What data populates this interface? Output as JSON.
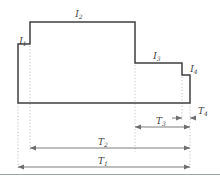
{
  "figure": {
    "type": "step-profile-dimension-diagram",
    "colors": {
      "outline": "#3f3f3f",
      "extension_line": "#bdbdbd",
      "dimension_line": "#7a7a7a",
      "label_text": "#3a3a3a",
      "divider": "#9aa7a0",
      "background": "#ffffff"
    },
    "interval_labels": [
      {
        "id": "I1",
        "base": "I",
        "sub": "1",
        "x": 23,
        "y": 44
      },
      {
        "id": "I2",
        "base": "I",
        "sub": "2",
        "x": 79,
        "y": 17
      },
      {
        "id": "I3",
        "base": "I",
        "sub": "3",
        "x": 157,
        "y": 59
      },
      {
        "id": "I4",
        "base": "I",
        "sub": "4",
        "x": 194,
        "y": 72
      }
    ],
    "dimension_labels": [
      {
        "id": "T1",
        "base": "T",
        "sub": "1",
        "x": 103,
        "y": 163
      },
      {
        "id": "T2",
        "base": "T",
        "sub": "2",
        "x": 103,
        "y": 144
      },
      {
        "id": "T3",
        "base": "T",
        "sub": "3",
        "x": 161,
        "y": 124
      },
      {
        "id": "T4",
        "base": "T",
        "sub": "4",
        "x": 201,
        "y": 113
      }
    ],
    "outline_path": "M 18,103 L 18,44 L 30,44 L 30,22 L 135,22 L 135,63 L 182,63 L 182,75 L 190,75 L 190,103 Z",
    "extension_lines": [
      {
        "id": "ext-left",
        "x": 18,
        "y1": 103,
        "y2": 170
      },
      {
        "id": "ext-step1",
        "x": 30,
        "y1": 46,
        "y2": 152
      },
      {
        "id": "ext-step2",
        "x": 135,
        "y1": 65,
        "y2": 152
      },
      {
        "id": "ext-step3",
        "x": 182,
        "y1": 77,
        "y2": 122
      },
      {
        "id": "ext-right",
        "x": 190,
        "y1": 103,
        "y2": 170
      }
    ],
    "dimension_lines": [
      {
        "id": "dim-T4",
        "x1": 182,
        "x2": 190,
        "y": 118,
        "arrows": "both-outer"
      },
      {
        "id": "dim-T3",
        "x1": 135,
        "x2": 190,
        "y": 127,
        "arrows": "both"
      },
      {
        "id": "dim-T2",
        "x1": 30,
        "x2": 190,
        "y": 148,
        "arrows": "both"
      },
      {
        "id": "dim-T1",
        "x1": 18,
        "x2": 190,
        "y": 167,
        "arrows": "both"
      }
    ],
    "divider": {
      "y": 174,
      "x1": 0,
      "x2": 220
    }
  }
}
